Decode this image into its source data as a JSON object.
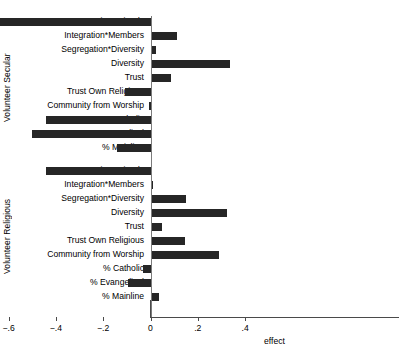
{
  "chart_data": {
    "type": "bar",
    "orientation": "horizontal",
    "title": "",
    "xlabel": "effect",
    "ylabel": "",
    "xlim": [
      -0.66,
      0.42
    ],
    "xticks": [
      -0.6,
      -0.4,
      -0.2,
      0,
      0.2,
      0.4
    ],
    "xticklabels": [
      "−.6",
      "−.4",
      "−.2",
      "0",
      ".2",
      ".4"
    ],
    "grid": false,
    "legend": null,
    "zero_reference_line": 0,
    "groups": [
      {
        "name": "Volunteer Secular",
        "categories": [
          "Integration*Friends",
          "Integration*Members",
          "Segregation*Diversity",
          "Diversity",
          "Trust",
          "Trust Own Religious",
          "Community from Worship",
          "% Catholic",
          "% Evangelical",
          "% Mainline"
        ],
        "values": [
          -0.635,
          0.113,
          0.022,
          0.335,
          0.087,
          -0.109,
          -0.008,
          -0.44,
          -0.503,
          -0.141
        ]
      },
      {
        "name": "Volunteer Religious",
        "categories": [
          "Integration*Friends",
          "Integration*Members",
          "Segregation*Diversity",
          "Diversity",
          "Trust",
          "Trust Own Religious",
          "Community from Worship",
          "% Catholic",
          "% Evangelical",
          "% Mainline"
        ],
        "values": [
          -0.44,
          0.009,
          0.15,
          0.325,
          0.05,
          0.145,
          0.29,
          -0.03,
          -0.095,
          0.035
        ]
      }
    ]
  },
  "style": {
    "bar_color": "#262626",
    "axis_color": "#4a4a4a",
    "zero_line_color": "#7b7b7b",
    "background": "#ffffff"
  }
}
